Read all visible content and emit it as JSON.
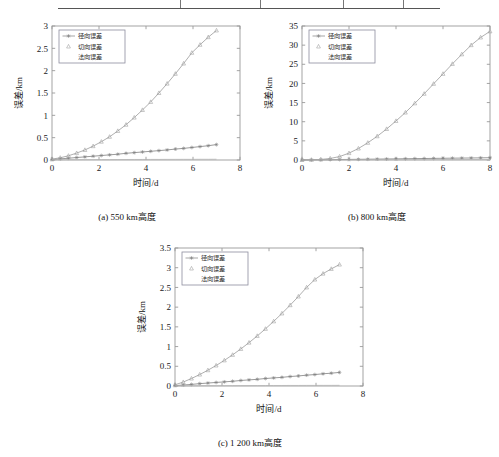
{
  "table_fragment": {
    "name": "table-bottom-edge-fragment",
    "divider_positions_px": [
      122,
      202,
      285,
      345
    ]
  },
  "figure": {
    "panels": [
      {
        "id": "a",
        "caption": "(a) 550 km高度",
        "xlabel": "时间/d",
        "ylabel": "误差/km",
        "legend": [
          "径向误差",
          "切向误差",
          "法向误差"
        ]
      },
      {
        "id": "b",
        "caption": "(b) 800 km高度",
        "xlabel": "时间/d",
        "ylabel": "误差/km",
        "legend": [
          "径向误差",
          "切向误差",
          "法向误差"
        ]
      },
      {
        "id": "c",
        "caption": "(c) 1 200 km高度",
        "xlabel": "时间/d",
        "ylabel": "误差/km",
        "legend": [
          "径向误差",
          "切向误差",
          "法向误差"
        ]
      }
    ]
  },
  "chart_data": [
    {
      "type": "line",
      "id": "a",
      "title": "(a) 550 km高度",
      "xlabel": "时间/d",
      "ylabel": "误差/km",
      "xlim": [
        0,
        8
      ],
      "ylim": [
        0,
        3
      ],
      "xticks": [
        0,
        2,
        4,
        6,
        8
      ],
      "xticklabels": [
        "0",
        "2",
        "4",
        "6",
        "8"
      ],
      "yticks": [
        0,
        0.5,
        1,
        1.5,
        2,
        2.5,
        3
      ],
      "yticklabels": [
        "0",
        "0.5",
        "1",
        "1.5",
        "2",
        "2.5",
        "3"
      ],
      "grid": false,
      "legend_position": "upper left",
      "x": [
        0,
        0.35,
        0.7,
        1.05,
        1.4,
        1.75,
        2.1,
        2.45,
        2.8,
        3.15,
        3.5,
        3.85,
        4.2,
        4.55,
        4.9,
        5.25,
        5.6,
        5.95,
        6.3,
        6.65,
        7.0
      ],
      "series": [
        {
          "name": "径向误差",
          "marker": "star",
          "color": "#808080",
          "values": [
            0.01,
            0.025,
            0.04,
            0.055,
            0.07,
            0.085,
            0.1,
            0.115,
            0.13,
            0.15,
            0.165,
            0.18,
            0.195,
            0.21,
            0.225,
            0.245,
            0.26,
            0.28,
            0.3,
            0.32,
            0.345
          ]
        },
        {
          "name": "切向误差",
          "marker": "triangle",
          "color": "#9a9a9a",
          "values": [
            0.02,
            0.05,
            0.095,
            0.155,
            0.225,
            0.31,
            0.41,
            0.52,
            0.65,
            0.79,
            0.95,
            1.12,
            1.3,
            1.5,
            1.71,
            1.93,
            2.16,
            2.4,
            2.58,
            2.75,
            2.9
          ]
        },
        {
          "name": "法向误差",
          "marker": "none",
          "color": "#b5b5b5",
          "values": [
            0.005,
            0.006,
            0.007,
            0.008,
            0.009,
            0.009,
            0.01,
            0.01,
            0.011,
            0.011,
            0.012,
            0.012,
            0.013,
            0.013,
            0.014,
            0.014,
            0.015,
            0.015,
            0.016,
            0.016,
            0.017
          ]
        }
      ]
    },
    {
      "type": "line",
      "id": "b",
      "title": "(b) 800 km高度",
      "xlabel": "时间/d",
      "ylabel": "误差/km",
      "xlim": [
        0,
        8
      ],
      "ylim": [
        0,
        35
      ],
      "xticks": [
        0,
        2,
        4,
        6,
        8
      ],
      "xticklabels": [
        "0",
        "2",
        "4",
        "6",
        "8"
      ],
      "yticks": [
        0,
        5,
        10,
        15,
        20,
        25,
        30,
        35
      ],
      "yticklabels": [
        "0",
        "5",
        "10",
        "15",
        "20",
        "25",
        "30",
        "35"
      ],
      "grid": false,
      "legend_position": "upper left",
      "x": [
        0,
        0.4,
        0.8,
        1.2,
        1.6,
        2.0,
        2.4,
        2.8,
        3.2,
        3.6,
        4.0,
        4.4,
        4.8,
        5.2,
        5.6,
        6.0,
        6.4,
        6.8,
        7.2,
        7.6,
        8.0
      ],
      "series": [
        {
          "name": "径向误差",
          "marker": "star",
          "color": "#808080",
          "values": [
            0.0,
            0.03,
            0.06,
            0.09,
            0.12,
            0.15,
            0.18,
            0.21,
            0.24,
            0.27,
            0.3,
            0.33,
            0.36,
            0.39,
            0.42,
            0.45,
            0.48,
            0.5,
            0.53,
            0.56,
            0.6
          ]
        },
        {
          "name": "切向误差",
          "marker": "triangle",
          "color": "#9a9a9a",
          "values": [
            0.0,
            0.05,
            0.15,
            0.4,
            0.9,
            1.8,
            3.0,
            4.5,
            6.2,
            8.1,
            10.2,
            12.4,
            14.8,
            17.3,
            19.9,
            22.5,
            25.1,
            27.6,
            30.0,
            32.0,
            33.6
          ]
        },
        {
          "name": "法向误差",
          "marker": "none",
          "color": "#b5b5b5",
          "values": [
            0.0,
            0.01,
            0.02,
            0.03,
            0.04,
            0.05,
            0.05,
            0.06,
            0.07,
            0.07,
            0.08,
            0.08,
            0.09,
            0.09,
            0.1,
            0.1,
            0.11,
            0.11,
            0.12,
            0.12,
            0.13
          ]
        }
      ]
    },
    {
      "type": "line",
      "id": "c",
      "title": "(c) 1 200 km高度",
      "xlabel": "时间/d",
      "ylabel": "误差/km",
      "xlim": [
        0,
        8
      ],
      "ylim": [
        0,
        3.5
      ],
      "xticks": [
        0,
        2,
        4,
        6,
        8
      ],
      "xticklabels": [
        "0",
        "2",
        "4",
        "6",
        "8"
      ],
      "yticks": [
        0,
        0.5,
        1,
        1.5,
        2,
        2.5,
        3,
        3.5
      ],
      "yticklabels": [
        "0",
        "0.5",
        "1",
        "1.5",
        "2",
        "2.5",
        "3",
        "3.5"
      ],
      "grid": false,
      "legend_position": "upper left",
      "x": [
        0,
        0.35,
        0.7,
        1.05,
        1.4,
        1.75,
        2.1,
        2.45,
        2.8,
        3.15,
        3.5,
        3.85,
        4.2,
        4.55,
        4.9,
        5.25,
        5.6,
        5.95,
        6.3,
        6.65,
        7.0
      ],
      "series": [
        {
          "name": "径向误差",
          "marker": "star",
          "color": "#808080",
          "values": [
            0.01,
            0.025,
            0.04,
            0.06,
            0.075,
            0.09,
            0.105,
            0.12,
            0.14,
            0.155,
            0.17,
            0.19,
            0.205,
            0.22,
            0.24,
            0.255,
            0.275,
            0.29,
            0.31,
            0.325,
            0.345
          ]
        },
        {
          "name": "切向误差",
          "marker": "triangle",
          "color": "#9a9a9a",
          "values": [
            0.03,
            0.1,
            0.19,
            0.29,
            0.4,
            0.52,
            0.65,
            0.79,
            0.94,
            1.1,
            1.27,
            1.45,
            1.64,
            1.84,
            2.05,
            2.27,
            2.5,
            2.7,
            2.85,
            2.97,
            3.08
          ]
        },
        {
          "name": "法向误差",
          "marker": "none",
          "color": "#b5b5b5",
          "values": [
            0.005,
            0.006,
            0.007,
            0.008,
            0.009,
            0.009,
            0.01,
            0.01,
            0.011,
            0.011,
            0.012,
            0.012,
            0.013,
            0.013,
            0.014,
            0.014,
            0.015,
            0.015,
            0.016,
            0.016,
            0.017
          ]
        }
      ]
    }
  ]
}
